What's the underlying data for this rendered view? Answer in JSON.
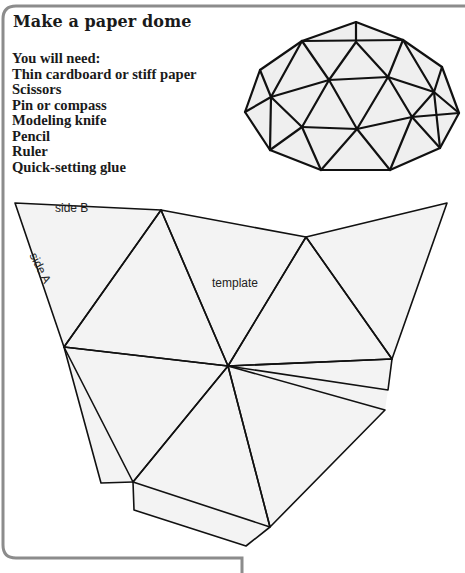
{
  "title": "Make a paper dome",
  "materials": {
    "heading": "You will need:",
    "items": [
      "Thin cardboard or stiff paper",
      "Scissors",
      "Pin or compass",
      "Modeling knife",
      "Pencil",
      "Ruler",
      "Quick-setting glue"
    ]
  },
  "illustrations": {
    "dome": {
      "description": "geodesic-dome-drawing"
    },
    "template": {
      "label": "template",
      "side_a_label": "side A",
      "side_b_label": "side B"
    }
  },
  "colors": {
    "frame": "#8c8c8c",
    "line": "#111111",
    "fill": "#f2f2f2"
  }
}
